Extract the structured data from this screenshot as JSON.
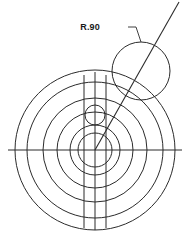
{
  "drawing": {
    "title": "Concentric circle engineering sketch",
    "background_color": "#ffffff",
    "line_color": "#2b2b2b",
    "text_color": "#1a1a1a",
    "canvas": {
      "width": 192,
      "height": 249
    },
    "annotations": [
      {
        "id": "radius-callout",
        "label": "R.90",
        "text_x": 100,
        "text_y": 30,
        "leader": "M 128 27 L 136 27 L 141 42"
      }
    ]
  },
  "chart_data": {
    "type": "scatter",
    "xlabel": "",
    "ylabel": "",
    "center": {
      "x": 95,
      "y": 150
    },
    "circles": [
      {
        "name": "outer-circle-1",
        "cx": 95,
        "cy": 150,
        "r": 80
      },
      {
        "name": "outer-circle-2",
        "cx": 95,
        "cy": 150,
        "r": 68
      },
      {
        "name": "mid-circle-1",
        "cx": 95,
        "cy": 150,
        "r": 52
      },
      {
        "name": "mid-circle-2",
        "cx": 95,
        "cy": 150,
        "r": 38
      },
      {
        "name": "inner-circle-1",
        "cx": 95,
        "cy": 150,
        "r": 25
      },
      {
        "name": "inner-circle-2",
        "cx": 95,
        "cy": 150,
        "r": 17
      },
      {
        "name": "small-bore-circle",
        "cx": 95,
        "cy": 115,
        "r": 10
      },
      {
        "name": "radius-90-circle",
        "cx": 141,
        "cy": 71,
        "r": 29
      }
    ],
    "lines": [
      {
        "name": "horizontal-centerline",
        "x1": 8,
        "y1": 150,
        "x2": 182,
        "y2": 150
      },
      {
        "name": "vertical-line-left",
        "x1": 84,
        "y1": 75,
        "x2": 84,
        "y2": 228
      },
      {
        "name": "vertical-line-center",
        "x1": 95,
        "y1": 72,
        "x2": 95,
        "y2": 230
      },
      {
        "name": "vertical-line-right",
        "x1": 106,
        "y1": 75,
        "x2": 106,
        "y2": 228
      },
      {
        "name": "diagonal-radius-line",
        "x1": 95,
        "y1": 150,
        "x2": 179,
        "y2": 2
      }
    ],
    "labels": [
      {
        "text": "R.90",
        "x": 100,
        "y": 30
      }
    ]
  }
}
